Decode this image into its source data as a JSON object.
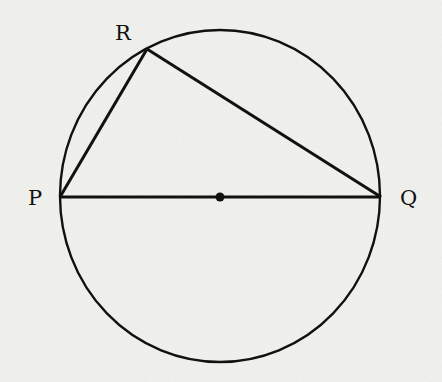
{
  "diagram": {
    "type": "geometry",
    "background": "#efefec",
    "stroke": "#111111",
    "circle": {
      "cx": 220,
      "cy": 196,
      "rx": 160,
      "ry": 166
    },
    "center_dot": {
      "x": 220,
      "y": 197
    },
    "points": {
      "P": {
        "label": "P",
        "x": 60,
        "y": 197
      },
      "Q": {
        "label": "Q",
        "x": 381,
        "y": 197
      },
      "R": {
        "label": "R",
        "x": 147,
        "y": 49
      }
    },
    "segments": [
      [
        "P",
        "Q"
      ],
      [
        "P",
        "R"
      ],
      [
        "R",
        "Q"
      ]
    ]
  }
}
